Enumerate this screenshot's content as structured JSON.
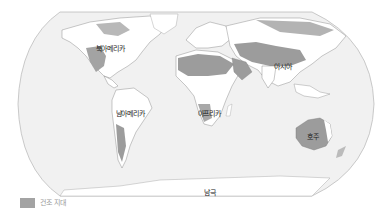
{
  "map": {
    "projection": "robinson",
    "colors": {
      "ocean": "#f1f1f1",
      "land": "#ffffff",
      "dry_zone": "#9c9c9c",
      "dry_zone_light": "#c4c4c4",
      "border": "#555555",
      "frame": "#bdbdbd"
    },
    "labels": {
      "north_america": "북아메리카",
      "south_america": "남아메리카",
      "africa": "아프리카",
      "asia": "아시아",
      "australia": "호주",
      "antarctica": "남극"
    }
  },
  "legend": {
    "items": [
      {
        "label": "건조 지대",
        "color": "#a3a3a3"
      }
    ]
  }
}
